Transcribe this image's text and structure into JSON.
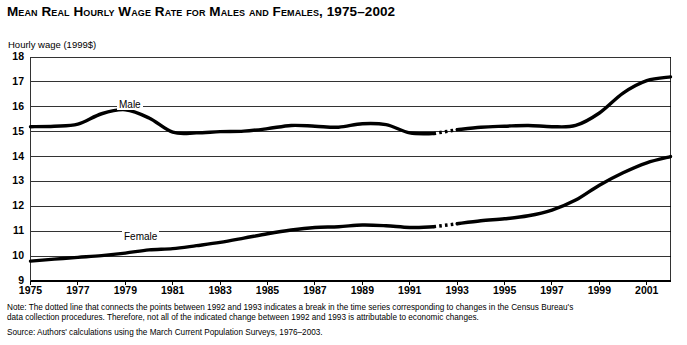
{
  "chart_data": {
    "type": "line",
    "title": "Mean Real Hourly Wage Rate for Males and Females, 1975–2002",
    "xlabel": "",
    "ylabel": "Hourly wage (1999$)",
    "ylim": [
      9,
      18
    ],
    "xlim": [
      1975,
      2002
    ],
    "grid": true,
    "legend": "inline-series-labels",
    "ytick_labels": [
      "18",
      "17",
      "16",
      "15",
      "14",
      "13",
      "12",
      "11",
      "10",
      "9"
    ],
    "ytick_values": [
      18,
      17,
      16,
      15,
      14,
      13,
      12,
      11,
      10,
      9
    ],
    "xtick_labels": [
      "1975",
      "1977",
      "1979",
      "1981",
      "1983",
      "1985",
      "1987",
      "1989",
      "1991",
      "1993",
      "1995",
      "1997",
      "1999",
      "2001"
    ],
    "xtick_values": [
      1975,
      1977,
      1979,
      1981,
      1983,
      1985,
      1987,
      1989,
      1991,
      1993,
      1995,
      1997,
      1999,
      2001
    ],
    "x": [
      1975,
      1976,
      1977,
      1978,
      1979,
      1980,
      1981,
      1982,
      1983,
      1984,
      1985,
      1986,
      1987,
      1988,
      1989,
      1990,
      1991,
      1992,
      1993,
      1994,
      1995,
      1996,
      1997,
      1998,
      1999,
      2000,
      2001,
      2002
    ],
    "break_between": [
      1992,
      1993
    ],
    "break_style": "dotted",
    "series": [
      {
        "name": "Male",
        "label": "Male",
        "color": "#000000",
        "values": [
          15.2,
          15.22,
          15.3,
          15.72,
          15.88,
          15.55,
          14.98,
          14.95,
          15.0,
          15.02,
          15.12,
          15.25,
          15.22,
          15.18,
          15.32,
          15.28,
          14.95,
          14.92,
          15.08,
          15.18,
          15.22,
          15.25,
          15.2,
          15.25,
          15.75,
          16.55,
          17.05,
          17.2
        ]
      },
      {
        "name": "Female",
        "label": "Female",
        "color": "#000000",
        "values": [
          9.8,
          9.88,
          9.95,
          10.02,
          10.12,
          10.25,
          10.3,
          10.42,
          10.55,
          10.72,
          10.9,
          11.05,
          11.15,
          11.18,
          11.25,
          11.22,
          11.15,
          11.18,
          11.3,
          11.42,
          11.5,
          11.62,
          11.85,
          12.25,
          12.85,
          13.35,
          13.75,
          14.0
        ]
      }
    ]
  },
  "notes": {
    "note": "Note: The dotted line that connects the points between 1992 and 1993 indicates a break in the time series corresponding to changes in the Census Bureau's",
    "note_cont": "data collection procedures. Therefore, not all of the indicated change between 1992 and 1993 is attributable to economic changes.",
    "source": "Source: Authors' calculations using the March Current Population Surveys, 1976–2003."
  }
}
